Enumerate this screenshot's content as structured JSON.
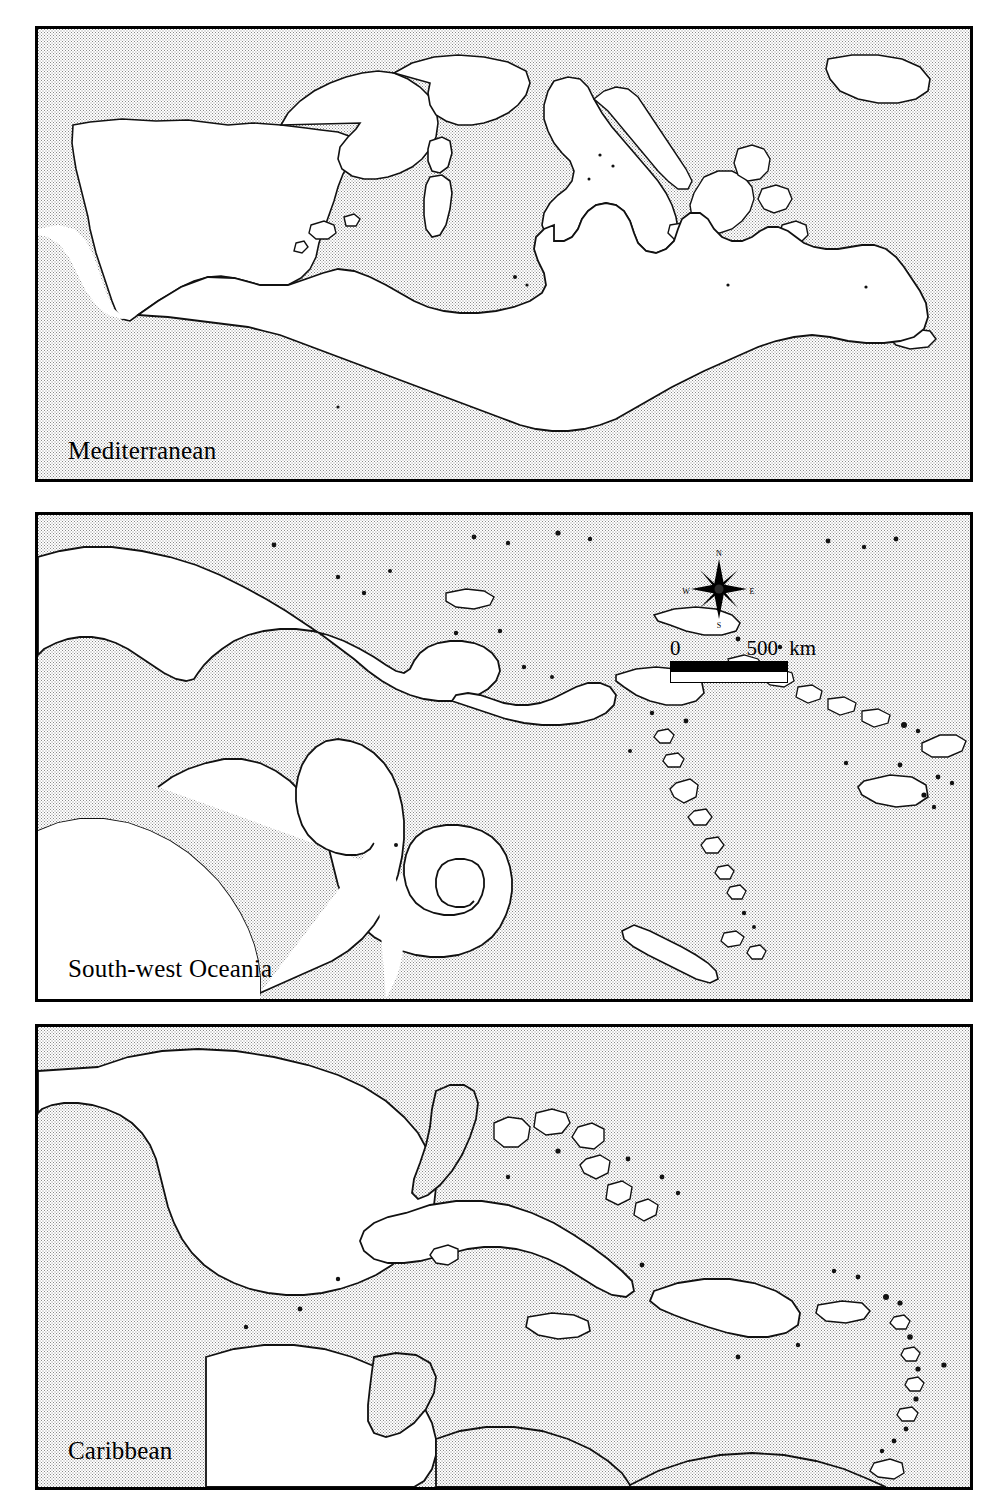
{
  "figure": {
    "type": "multi-panel-locator-map",
    "panel_count": 3,
    "land_fill": "#c9c9c9",
    "sea_fill": "#ffffff",
    "coastline_color": "#000000",
    "frame_color": "#000000"
  },
  "panels": [
    {
      "id": "mediterranean",
      "label": "Mediterranean",
      "has_compass": false,
      "has_scalebar": false
    },
    {
      "id": "oceania",
      "label": "South-west Oceania",
      "has_compass": true,
      "has_scalebar": true
    },
    {
      "id": "caribbean",
      "label": "Caribbean",
      "has_compass": false,
      "has_scalebar": false
    }
  ],
  "compass": {
    "north": "N",
    "south": "S",
    "east": "E",
    "west": "W"
  },
  "scalebar": {
    "min": "0",
    "max": "500",
    "unit": "km"
  }
}
